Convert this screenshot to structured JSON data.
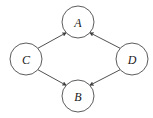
{
  "figure": {
    "kind": "directed-graph",
    "background_color": "#ffffff",
    "stroke_color": "#3c3c3c",
    "label_color": "#1a1a1a",
    "width": 153,
    "height": 118
  },
  "nodes": [
    {
      "id": "A",
      "label": "A",
      "cx": 78,
      "cy": 22,
      "r": 16
    },
    {
      "id": "C",
      "label": "C",
      "cx": 26,
      "cy": 59,
      "r": 16
    },
    {
      "id": "D",
      "label": "D",
      "cx": 132,
      "cy": 59,
      "r": 16
    },
    {
      "id": "B",
      "label": "B",
      "cx": 78,
      "cy": 96,
      "r": 16
    }
  ],
  "edges": [
    {
      "id": "C-A",
      "from": "C",
      "to": "A",
      "arrow": "to",
      "x1": 37.8,
      "y1": 48.3,
      "x2": 66.2,
      "y2": 32.7
    },
    {
      "id": "D-A",
      "from": "D",
      "to": "A",
      "arrow": "to",
      "x1": 120.2,
      "y1": 48.3,
      "x2": 89.8,
      "y2": 32.7
    },
    {
      "id": "C-B",
      "from": "C",
      "to": "B",
      "arrow": "to",
      "x1": 37.8,
      "y1": 69.7,
      "x2": 66.2,
      "y2": 85.3
    },
    {
      "id": "D-B",
      "from": "D",
      "to": "B",
      "arrow": "to",
      "x1": 120.2,
      "y1": 69.7,
      "x2": 89.8,
      "y2": 85.3
    }
  ]
}
